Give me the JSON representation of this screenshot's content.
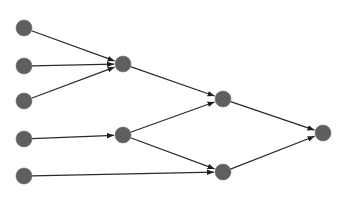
{
  "diagram": {
    "type": "directed-graph",
    "width": 347,
    "height": 200,
    "node_color": "#5f5f5f",
    "edge_color": "#2a2a2a",
    "node_radius": 8,
    "nodes": [
      {
        "id": "a1",
        "x": 24,
        "y": 28
      },
      {
        "id": "a2",
        "x": 24,
        "y": 66
      },
      {
        "id": "a3",
        "x": 24,
        "y": 101
      },
      {
        "id": "a4",
        "x": 24,
        "y": 139
      },
      {
        "id": "a5",
        "x": 24,
        "y": 176
      },
      {
        "id": "b1",
        "x": 123,
        "y": 64
      },
      {
        "id": "b2",
        "x": 123,
        "y": 135
      },
      {
        "id": "c1",
        "x": 223,
        "y": 99
      },
      {
        "id": "c2",
        "x": 223,
        "y": 172
      },
      {
        "id": "d1",
        "x": 323,
        "y": 133
      }
    ],
    "edges": [
      {
        "from": "a1",
        "to": "b1"
      },
      {
        "from": "a2",
        "to": "b1"
      },
      {
        "from": "a3",
        "to": "b1"
      },
      {
        "from": "a4",
        "to": "b2"
      },
      {
        "from": "a5",
        "to": "c2"
      },
      {
        "from": "b1",
        "to": "c1"
      },
      {
        "from": "b2",
        "to": "c1"
      },
      {
        "from": "b2",
        "to": "c2"
      },
      {
        "from": "c1",
        "to": "d1"
      },
      {
        "from": "c2",
        "to": "d1"
      }
    ]
  }
}
